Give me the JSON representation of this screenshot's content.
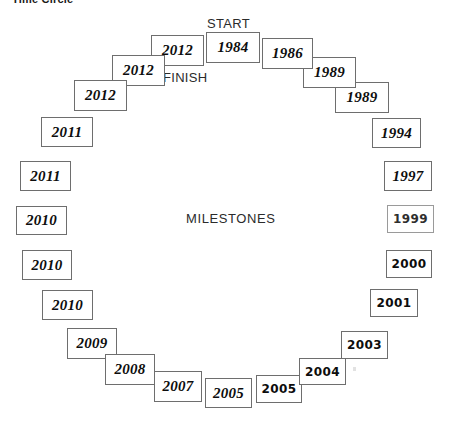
{
  "title": "Time Circle",
  "captions": {
    "start": "START",
    "finish": "FINISH",
    "center": "MILESTONES"
  },
  "milestones": [
    {
      "id": "m-1984",
      "year": "1984",
      "x": 206,
      "y": 32,
      "w": 54,
      "h": 31,
      "style": "italic"
    },
    {
      "id": "m-1986",
      "year": "1986",
      "x": 262,
      "y": 38,
      "w": 51,
      "h": 31,
      "style": "italic"
    },
    {
      "id": "m-1989a",
      "year": "1989",
      "x": 303,
      "y": 57,
      "w": 53,
      "h": 31,
      "style": "italic"
    },
    {
      "id": "m-1989b",
      "year": "1989",
      "x": 335,
      "y": 82,
      "w": 54,
      "h": 31,
      "style": "italic"
    },
    {
      "id": "m-1994",
      "year": "1994",
      "x": 372,
      "y": 118,
      "w": 49,
      "h": 30,
      "style": "italic"
    },
    {
      "id": "m-1997",
      "year": "1997",
      "x": 384,
      "y": 161,
      "w": 48,
      "h": 30,
      "style": "italic"
    },
    {
      "id": "m-1999",
      "year": "1999",
      "x": 387,
      "y": 205,
      "w": 47,
      "h": 28,
      "style": "upright",
      "faded": true
    },
    {
      "id": "m-2000",
      "year": "2000",
      "x": 386,
      "y": 250,
      "w": 46,
      "h": 28,
      "style": "upright"
    },
    {
      "id": "m-2001",
      "year": "2001",
      "x": 370,
      "y": 289,
      "w": 48,
      "h": 28,
      "style": "upright"
    },
    {
      "id": "m-2003",
      "year": "2003",
      "x": 341,
      "y": 331,
      "w": 47,
      "h": 28,
      "style": "upright"
    },
    {
      "id": "m-2004",
      "year": "2004",
      "x": 299,
      "y": 358,
      "w": 47,
      "h": 27,
      "style": "upright"
    },
    {
      "id": "m-2005b",
      "year": "2005",
      "x": 256,
      "y": 375,
      "w": 46,
      "h": 28,
      "style": "upright"
    },
    {
      "id": "m-2005a",
      "year": "2005",
      "x": 205,
      "y": 378,
      "w": 47,
      "h": 30,
      "style": "italic"
    },
    {
      "id": "m-2007a",
      "year": "2007",
      "x": 154,
      "y": 371,
      "w": 48,
      "h": 31,
      "style": "italic"
    },
    {
      "id": "m-2008",
      "year": "2008",
      "x": 105,
      "y": 354,
      "w": 50,
      "h": 31,
      "style": "italic"
    },
    {
      "id": "m-2009",
      "year": "2009",
      "x": 67,
      "y": 328,
      "w": 50,
      "h": 31,
      "style": "italic"
    },
    {
      "id": "m-2010c",
      "year": "2010",
      "x": 42,
      "y": 290,
      "w": 51,
      "h": 30,
      "style": "italic"
    },
    {
      "id": "m-2010b",
      "year": "2010",
      "x": 22,
      "y": 250,
      "w": 50,
      "h": 30,
      "style": "italic"
    },
    {
      "id": "m-2010a",
      "year": "2010",
      "x": 16,
      "y": 206,
      "w": 51,
      "h": 29,
      "style": "italic"
    },
    {
      "id": "m-2011b",
      "year": "2011",
      "x": 20,
      "y": 161,
      "w": 51,
      "h": 30,
      "style": "italic"
    },
    {
      "id": "m-2011a",
      "year": "2011",
      "x": 41,
      "y": 117,
      "w": 52,
      "h": 30,
      "style": "italic"
    },
    {
      "id": "m-2012c",
      "year": "2012",
      "x": 74,
      "y": 80,
      "w": 53,
      "h": 31,
      "style": "italic"
    },
    {
      "id": "m-2012b",
      "year": "2012",
      "x": 112,
      "y": 55,
      "w": 53,
      "h": 31,
      "style": "italic"
    },
    {
      "id": "m-2012a",
      "year": "2012",
      "x": 151,
      "y": 35,
      "w": 53,
      "h": 31,
      "style": "italic"
    }
  ],
  "colors": {
    "box_border": "#6e6e6e",
    "box_border_faded": "#9a9a9a",
    "box_fill": "#ffffff",
    "text": "#0d0d0d",
    "caption_text": "#2b2b2b",
    "title_text": "#1a1a1a",
    "background": "#ffffff"
  }
}
